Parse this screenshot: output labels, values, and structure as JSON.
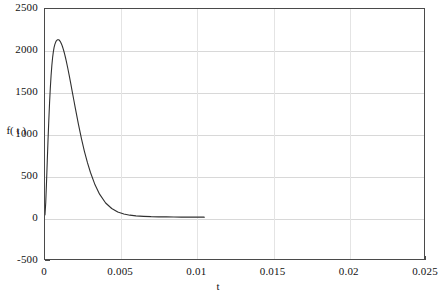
{
  "chart_data": {
    "type": "line",
    "title": "",
    "xlabel": "t",
    "ylabel": "f( t )",
    "xlim": [
      0,
      0.025
    ],
    "ylim": [
      -500,
      2500
    ],
    "grid": true,
    "legend": null,
    "xticks": [
      "0",
      "0.005",
      "0.01",
      "0.015",
      "0.02",
      "0.025"
    ],
    "xtick_values": [
      0,
      0.005,
      0.01,
      0.015,
      0.02,
      0.025
    ],
    "yticks": [
      "-500",
      "0",
      "500",
      "1000",
      "1500",
      "2000",
      "2500"
    ],
    "ytick_values": [
      -500,
      0,
      500,
      1000,
      1500,
      2000,
      2500
    ],
    "gridlines_y": [
      0,
      500,
      1000,
      1500,
      2000
    ],
    "gridlines_x": [
      0.005,
      0.01,
      0.015,
      0.02
    ],
    "series": [
      {
        "name": "f(t)",
        "color": "#303030",
        "x": [
          0,
          5e-05,
          0.0001,
          0.00015,
          0.0002,
          0.00025,
          0.0003,
          0.00035,
          0.0004,
          0.00045,
          0.0005,
          0.00055,
          0.0006,
          0.00065,
          0.0007,
          0.00075,
          0.0008,
          0.00085,
          0.0009,
          0.00095,
          0.001,
          0.00105,
          0.0011,
          0.00115,
          0.0012,
          0.00125,
          0.0013,
          0.00135,
          0.0014,
          0.0015,
          0.0016,
          0.0017,
          0.0018,
          0.0019,
          0.002,
          0.0022,
          0.0024,
          0.0026,
          0.0028,
          0.003,
          0.0033,
          0.0036,
          0.004,
          0.0044,
          0.0048,
          0.0052,
          0.0056,
          0.006,
          0.0065,
          0.007,
          0.0075,
          0.008,
          0.0085,
          0.009,
          0.0095,
          0.01,
          0.0103,
          0.0105
        ],
        "y": [
          30,
          180,
          420,
          680,
          930,
          1160,
          1370,
          1550,
          1700,
          1820,
          1915,
          1985,
          2040,
          2075,
          2100,
          2118,
          2128,
          2132,
          2130,
          2124,
          2112,
          2096,
          2075,
          2050,
          2022,
          1990,
          1955,
          1918,
          1878,
          1792,
          1700,
          1604,
          1506,
          1408,
          1310,
          1122,
          948,
          792,
          656,
          538,
          390,
          278,
          172,
          106,
          64,
          40,
          26,
          18,
          12,
          8,
          6,
          5,
          4,
          3,
          3,
          2,
          2,
          2
        ],
        "peak": {
          "x": 0.00085,
          "y": 2132
        }
      }
    ]
  },
  "axes": {
    "ylabel_text": "f( t )",
    "xlabel_text": "t"
  }
}
